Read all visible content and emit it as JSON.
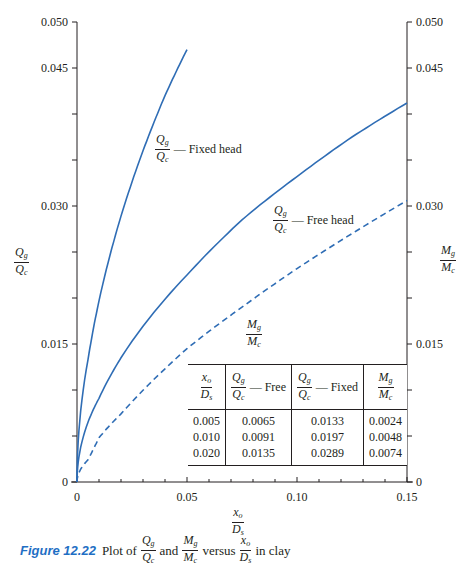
{
  "chart_data": {
    "type": "line",
    "title": "",
    "xlabel": "x_o / D_s",
    "ylabel_left": "Q_g / Q_c",
    "ylabel_right": "M_g / M_c",
    "xlim": [
      0,
      0.15
    ],
    "ylim": [
      0,
      0.05
    ],
    "x_ticks": [
      "0",
      "0.05",
      "0.10",
      "0.15"
    ],
    "y_ticks_left": [
      "0",
      "0.015",
      "0.030",
      "0.045",
      "0.050"
    ],
    "y_ticks_right": [
      "0",
      "0.015",
      "0.030",
      "0.045",
      "0.050"
    ],
    "grid": false,
    "series": [
      {
        "name": "Qg/Qc — Fixed head",
        "style": "solid",
        "x": [
          0,
          0.005,
          0.01,
          0.02,
          0.03,
          0.04,
          0.05
        ],
        "y": [
          0,
          0.0133,
          0.0197,
          0.0289,
          0.036,
          0.042,
          0.047
        ]
      },
      {
        "name": "Qg/Qc — Free head",
        "style": "solid",
        "x": [
          0,
          0.005,
          0.01,
          0.02,
          0.05,
          0.075,
          0.1,
          0.125,
          0.15
        ],
        "y": [
          0,
          0.0065,
          0.0091,
          0.0135,
          0.0225,
          0.0285,
          0.0332,
          0.0375,
          0.0412
        ]
      },
      {
        "name": "Mg/Mc",
        "style": "dashed",
        "x": [
          0,
          0.005,
          0.01,
          0.02,
          0.05,
          0.075,
          0.1,
          0.125,
          0.15
        ],
        "y": [
          0,
          0.0024,
          0.0048,
          0.0074,
          0.0145,
          0.019,
          0.0232,
          0.027,
          0.0306
        ]
      }
    ],
    "annotations": [
      "Qg/Qc — Fixed head",
      "Qg/Qc — Free head",
      "Mg/Mc"
    ],
    "line_color": "#2f6db5"
  },
  "table": {
    "headers": [
      {
        "num": "x",
        "num_sub": "o",
        "den": "D",
        "den_sub": "s",
        "suffix": ""
      },
      {
        "num": "Q",
        "num_sub": "g",
        "den": "Q",
        "den_sub": "c",
        "suffix": "— Free"
      },
      {
        "num": "Q",
        "num_sub": "g",
        "den": "Q",
        "den_sub": "c",
        "suffix": "— Fixed"
      },
      {
        "num": "M",
        "num_sub": "g",
        "den": "M",
        "den_sub": "c",
        "suffix": ""
      }
    ],
    "rows": [
      [
        "0.005",
        "0.0065",
        "0.0133",
        "0.0024"
      ],
      [
        "0.010",
        "0.0091",
        "0.0197",
        "0.0048"
      ],
      [
        "0.020",
        "0.0135",
        "0.0289",
        "0.0074"
      ]
    ]
  },
  "labels": {
    "fixed_head": "— Fixed head",
    "free_head": "— Free head",
    "Q": "Q",
    "g": "g",
    "c": "c",
    "M": "M",
    "x": "x",
    "o": "o",
    "D": "D",
    "s": "s"
  },
  "caption": {
    "figure": "Figure 12.22",
    "plot_of": "Plot of",
    "and": "and",
    "versus": "versus",
    "in_clay": "in clay"
  }
}
